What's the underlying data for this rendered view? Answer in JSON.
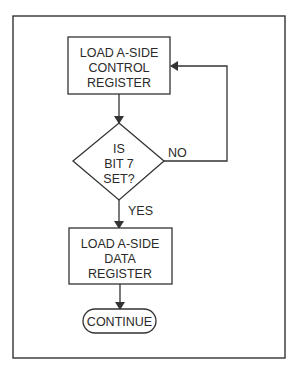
{
  "diagram": {
    "type": "flowchart",
    "colors": {
      "line": "#333333",
      "text": "#2a2a2a",
      "background": "#ffffff"
    },
    "nodes": {
      "load_control": {
        "shape": "rectangle",
        "lines": [
          "LOAD A-SIDE",
          "CONTROL",
          "REGISTER"
        ]
      },
      "decision": {
        "shape": "diamond",
        "lines": [
          "IS",
          "BIT 7",
          "SET?"
        ]
      },
      "load_data": {
        "shape": "rectangle",
        "lines": [
          "LOAD A-SIDE",
          "DATA",
          "REGISTER"
        ]
      },
      "continue": {
        "shape": "terminator",
        "label": "CONTINUE"
      }
    },
    "edges": {
      "no_label": "NO",
      "yes_label": "YES"
    }
  }
}
